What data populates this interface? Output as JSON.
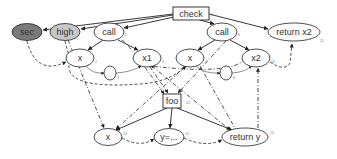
{
  "diagram": {
    "nodes": [
      {
        "id": "check",
        "label": "check",
        "num": "0",
        "shape": "rect",
        "x": 173,
        "y": 7,
        "w": 36,
        "h": 13
      },
      {
        "id": "sec",
        "label": "sec",
        "num": "",
        "shape": "ellipse",
        "cx": 27,
        "cy": 32,
        "rx": 15,
        "ry": 8.5,
        "fill": "#7a7a7a"
      },
      {
        "id": "high",
        "label": "high",
        "num": "",
        "shape": "ellipse",
        "cx": 65,
        "cy": 32,
        "rx": 15,
        "ry": 8.5,
        "fill": "#c8c8c8"
      },
      {
        "id": "call1",
        "label": "call",
        "num": "1",
        "shape": "ellipse",
        "cx": 109,
        "cy": 32,
        "rx": 15,
        "ry": 9,
        "fill": "#ffffff"
      },
      {
        "id": "x_a",
        "label": "x",
        "num": "2",
        "shape": "ellipse",
        "cx": 80,
        "cy": 58,
        "rx": 14,
        "ry": 9,
        "fill": "#ffffff"
      },
      {
        "id": "x1",
        "label": "x1",
        "num": "5",
        "shape": "ellipse",
        "cx": 147,
        "cy": 58,
        "rx": 14,
        "ry": 9,
        "fill": "#ffffff"
      },
      {
        "id": "circ1",
        "label": "",
        "num": "3",
        "shape": "ellipse",
        "cx": 110,
        "cy": 73,
        "rx": 6,
        "ry": 7,
        "fill": "#ffffff"
      },
      {
        "id": "call2",
        "label": "call",
        "num": "6",
        "shape": "ellipse",
        "cx": 222,
        "cy": 32,
        "rx": 15,
        "ry": 9,
        "fill": "#ffffff"
      },
      {
        "id": "x_b",
        "label": "x",
        "num": "7",
        "shape": "ellipse",
        "cx": 190,
        "cy": 58,
        "rx": 14,
        "ry": 9,
        "fill": "#ffffff"
      },
      {
        "id": "x2",
        "label": "x2",
        "num": "10",
        "shape": "ellipse",
        "cx": 256,
        "cy": 58,
        "rx": 14,
        "ry": 9,
        "fill": "#ffffff"
      },
      {
        "id": "circ2",
        "label": "",
        "num": "8",
        "shape": "ellipse",
        "cx": 226,
        "cy": 73,
        "rx": 6,
        "ry": 7,
        "fill": "#ffffff"
      },
      {
        "id": "return_x2",
        "label": "return x2",
        "num": "11",
        "shape": "ellipse",
        "cx": 294,
        "cy": 32,
        "rx": 26,
        "ry": 9,
        "fill": "#ffffff"
      },
      {
        "id": "foo",
        "label": "foo",
        "num": "12",
        "shape": "rect",
        "x": 163,
        "y": 94,
        "w": 18,
        "h": 14
      },
      {
        "id": "x_c",
        "label": "x",
        "num": "13",
        "shape": "ellipse",
        "cx": 108,
        "cy": 137,
        "rx": 14,
        "ry": 8.5,
        "fill": "#ffffff"
      },
      {
        "id": "y_assign",
        "label": "y=...",
        "num": "14",
        "shape": "ellipse",
        "cx": 169,
        "cy": 137,
        "rx": 15,
        "ry": 8.5,
        "fill": "#ffffff"
      },
      {
        "id": "return_y",
        "label": "return y",
        "num": "15",
        "shape": "ellipse",
        "cx": 245,
        "cy": 137,
        "rx": 23,
        "ry": 9,
        "fill": "#ffffff"
      }
    ],
    "edge_legend": {
      "solid": "control",
      "dashed": "data",
      "dashdot": "parameter"
    }
  }
}
